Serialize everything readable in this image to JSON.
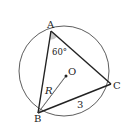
{
  "diagram": {
    "type": "geometry",
    "circle": {
      "center_label": "O",
      "radius_label": "R"
    },
    "points": {
      "A": {
        "label": "A"
      },
      "B": {
        "label": "B"
      },
      "C": {
        "label": "C"
      },
      "O": {
        "label": "O"
      }
    },
    "angle_A": {
      "label": "60°",
      "fill": "#c8c8c8"
    },
    "side_BC": {
      "label": "3"
    },
    "segment_BO": {
      "label": "R"
    },
    "colors": {
      "stroke": "#222222",
      "angle_fill": "#c8c8c8",
      "background": "#ffffff"
    }
  }
}
